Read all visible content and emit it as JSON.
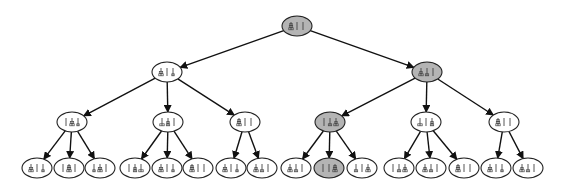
{
  "diagram": {
    "type": "tree",
    "colors": {
      "highlight": "#b4b4b4",
      "normal": "#ffffff",
      "stroke": "#222222"
    },
    "nodes": [
      {
        "id": "n0",
        "label": "A||",
        "pegs": [
          [
            3,
            2,
            1
          ],
          [],
          []
        ],
        "highlighted": true,
        "parent": null
      },
      {
        "id": "n1",
        "label": "d|d",
        "pegs": [
          [
            3,
            2
          ],
          [],
          [
            1
          ]
        ],
        "highlighted": false,
        "parent": "n0"
      },
      {
        "id": "n2",
        "label": "dd|",
        "pegs": [
          [
            3,
            1
          ],
          [
            2
          ],
          []
        ],
        "highlighted": true,
        "parent": "n0"
      },
      {
        "id": "n3",
        "label": "|dd",
        "pegs": [
          [],
          [
            3,
            2
          ],
          [
            1
          ]
        ],
        "highlighted": false,
        "parent": "n1"
      },
      {
        "id": "n4",
        "label": "dd|",
        "pegs": [
          [
            3
          ],
          [
            2,
            1
          ],
          []
        ],
        "highlighted": false,
        "parent": "n1"
      },
      {
        "id": "n5",
        "label": "A||",
        "pegs": [
          [
            3,
            2,
            1
          ],
          [],
          []
        ],
        "highlighted": false,
        "parent": "n1"
      },
      {
        "id": "n6",
        "label": "|dd",
        "pegs": [
          [],
          [
            2
          ],
          [
            3,
            1
          ]
        ],
        "highlighted": true,
        "parent": "n2"
      },
      {
        "id": "n7",
        "label": "d|d",
        "pegs": [
          [
            3
          ],
          [],
          [
            2,
            1
          ]
        ],
        "highlighted": false,
        "parent": "n2"
      },
      {
        "id": "n8",
        "label": "A||",
        "pegs": [
          [
            3,
            2,
            1
          ],
          [],
          []
        ],
        "highlighted": false,
        "parent": "n2"
      },
      {
        "id": "n9",
        "label": "d||",
        "pegs": [
          [
            3,
            2
          ],
          [],
          [
            1
          ]
        ],
        "highlighted": false,
        "parent": "n3"
      },
      {
        "id": "n10",
        "label": "|A|",
        "pegs": [
          [],
          [
            3,
            2,
            1
          ],
          []
        ],
        "highlighted": false,
        "parent": "n3"
      },
      {
        "id": "n11",
        "label": "dd|",
        "pegs": [
          [
            1
          ],
          [
            3,
            2
          ],
          []
        ],
        "highlighted": false,
        "parent": "n3"
      },
      {
        "id": "n12",
        "label": "|dd",
        "pegs": [
          [],
          [
            2,
            1
          ],
          [
            3
          ]
        ],
        "highlighted": false,
        "parent": "n4"
      },
      {
        "id": "n13",
        "label": "d|d",
        "pegs": [
          [
            3,
            2
          ],
          [],
          [
            1
          ]
        ],
        "highlighted": false,
        "parent": "n4"
      },
      {
        "id": "n14",
        "label": "A||",
        "pegs": [
          [
            3,
            2,
            1
          ],
          [],
          []
        ],
        "highlighted": false,
        "parent": "n4"
      },
      {
        "id": "n15",
        "label": "d|d",
        "pegs": [
          [
            3,
            2
          ],
          [],
          [
            1
          ]
        ],
        "highlighted": false,
        "parent": "n5"
      },
      {
        "id": "n16",
        "label": "dd|",
        "pegs": [
          [
            3,
            1
          ],
          [
            2
          ],
          []
        ],
        "highlighted": false,
        "parent": "n5"
      },
      {
        "id": "n17",
        "label": "dd|",
        "pegs": [
          [
            3,
            1
          ],
          [
            2
          ],
          []
        ],
        "highlighted": false,
        "parent": "n6"
      },
      {
        "id": "n18",
        "label": "||A",
        "pegs": [
          [],
          [],
          [
            3,
            2,
            1
          ]
        ],
        "highlighted": true,
        "parent": "n6"
      },
      {
        "id": "n19",
        "label": "d|d",
        "pegs": [
          [
            2
          ],
          [],
          [
            3,
            1
          ]
        ],
        "highlighted": false,
        "parent": "n6"
      },
      {
        "id": "n20",
        "label": "|dd",
        "pegs": [
          [],
          [
            2
          ],
          [
            3,
            1
          ]
        ],
        "highlighted": false,
        "parent": "n7"
      },
      {
        "id": "n21",
        "label": "dd|",
        "pegs": [
          [
            3,
            1
          ],
          [
            2
          ],
          []
        ],
        "highlighted": false,
        "parent": "n7"
      },
      {
        "id": "n22",
        "label": "A||",
        "pegs": [
          [
            3,
            2,
            1
          ],
          [],
          []
        ],
        "highlighted": false,
        "parent": "n7"
      },
      {
        "id": "n23",
        "label": "d|d",
        "pegs": [
          [
            3,
            2
          ],
          [],
          [
            1
          ]
        ],
        "highlighted": false,
        "parent": "n8"
      },
      {
        "id": "n24",
        "label": "dd|",
        "pegs": [
          [
            3,
            1
          ],
          [
            2
          ],
          []
        ],
        "highlighted": false,
        "parent": "n8"
      }
    ]
  }
}
